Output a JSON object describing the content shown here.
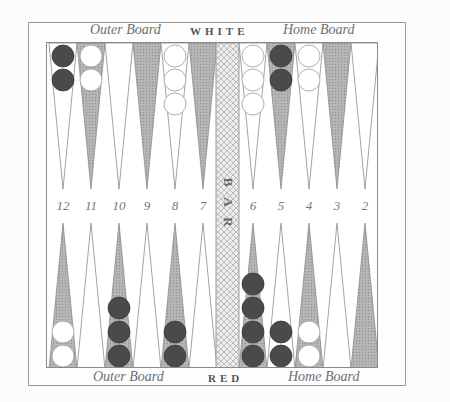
{
  "labels": {
    "top_left": "Outer Board",
    "top_center": "WHITE",
    "top_right": "Home Board",
    "bottom_left": "Outer Board",
    "bottom_center": "RED",
    "bottom_right": "Home Board",
    "bar": "BAR"
  },
  "colors": {
    "dark_point": "#a8a8a8",
    "light_point": "#ffffff",
    "point_outline": "#8c8c8c",
    "dark_checker": "#4a4a4a",
    "light_checker": "#ffffff",
    "bar_fill": "#d9d9d9"
  },
  "point_numbers": {
    "left": [
      "12",
      "11",
      "10",
      "9",
      "8",
      "7"
    ],
    "right": [
      "6",
      "5",
      "4",
      "3",
      "2",
      "1"
    ]
  },
  "points": {
    "top": [
      {
        "id": 13,
        "shade": "light",
        "checkers": {
          "color": "dark",
          "count": 2
        }
      },
      {
        "id": 14,
        "shade": "dark",
        "checkers": {
          "color": "light",
          "count": 2
        }
      },
      {
        "id": 15,
        "shade": "light",
        "checkers": {
          "color": "none",
          "count": 0
        }
      },
      {
        "id": 16,
        "shade": "dark",
        "checkers": {
          "color": "none",
          "count": 0
        }
      },
      {
        "id": 17,
        "shade": "light",
        "checkers": {
          "color": "light",
          "count": 3
        }
      },
      {
        "id": 18,
        "shade": "dark",
        "checkers": {
          "color": "none",
          "count": 0
        }
      },
      {
        "id": 19,
        "shade": "light",
        "checkers": {
          "color": "light",
          "count": 3
        }
      },
      {
        "id": 20,
        "shade": "dark",
        "checkers": {
          "color": "dark",
          "count": 2
        }
      },
      {
        "id": 21,
        "shade": "light",
        "checkers": {
          "color": "light",
          "count": 2
        }
      },
      {
        "id": 22,
        "shade": "dark",
        "checkers": {
          "color": "none",
          "count": 0
        }
      },
      {
        "id": 23,
        "shade": "light",
        "checkers": {
          "color": "none",
          "count": 0
        }
      },
      {
        "id": 24,
        "shade": "dark",
        "checkers": {
          "color": "none",
          "count": 0
        }
      }
    ],
    "bottom": [
      {
        "id": 12,
        "shade": "dark",
        "checkers": {
          "color": "light",
          "count": 2
        }
      },
      {
        "id": 11,
        "shade": "light",
        "checkers": {
          "color": "none",
          "count": 0
        }
      },
      {
        "id": 10,
        "shade": "dark",
        "checkers": {
          "color": "dark",
          "count": 3
        }
      },
      {
        "id": 9,
        "shade": "light",
        "checkers": {
          "color": "none",
          "count": 0
        }
      },
      {
        "id": 8,
        "shade": "dark",
        "checkers": {
          "color": "dark",
          "count": 2
        }
      },
      {
        "id": 7,
        "shade": "light",
        "checkers": {
          "color": "none",
          "count": 0
        }
      },
      {
        "id": 6,
        "shade": "dark",
        "checkers": {
          "color": "dark",
          "count": 4
        }
      },
      {
        "id": 5,
        "shade": "light",
        "checkers": {
          "color": "dark",
          "count": 2
        }
      },
      {
        "id": 4,
        "shade": "dark",
        "checkers": {
          "color": "light",
          "count": 2
        }
      },
      {
        "id": 3,
        "shade": "light",
        "checkers": {
          "color": "none",
          "count": 0
        }
      },
      {
        "id": 2,
        "shade": "dark",
        "checkers": {
          "color": "none",
          "count": 0
        }
      },
      {
        "id": 1,
        "shade": "light",
        "checkers": {
          "color": "light",
          "count": 1
        }
      }
    ]
  }
}
